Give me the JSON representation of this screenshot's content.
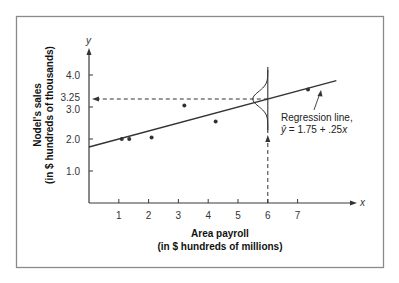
{
  "chart_data": {
    "type": "scatter",
    "title": "",
    "xlabel": "Area payroll",
    "xlabel_sub": "(in $ hundreds of millions)",
    "ylabel": "Nodel's sales",
    "ylabel_sub": "(in $ hundreds of thousands)",
    "x_var": "x",
    "y_var": "y",
    "xlim": [
      0,
      8.5
    ],
    "ylim": [
      0,
      4.6
    ],
    "x_ticks": [
      1,
      2,
      3,
      4,
      5,
      6,
      7
    ],
    "y_ticks": [
      {
        "value": 1.0,
        "label": "1.0"
      },
      {
        "value": 2.0,
        "label": "2.0"
      },
      {
        "value": 3.0,
        "label": "3.0"
      },
      {
        "value": 3.25,
        "label": "3.25"
      },
      {
        "value": 4.0,
        "label": "4.0"
      }
    ],
    "grid": false,
    "points": [
      {
        "x": 1.1,
        "y": 2.0
      },
      {
        "x": 1.35,
        "y": 2.0
      },
      {
        "x": 2.1,
        "y": 2.05
      },
      {
        "x": 3.2,
        "y": 3.05
      },
      {
        "x": 4.25,
        "y": 2.55
      },
      {
        "x": 7.35,
        "y": 3.55
      }
    ],
    "regression": {
      "intercept": 1.75,
      "slope": 0.25,
      "x_range": [
        0,
        8.3
      ],
      "label_line1": "Regression line,",
      "label_line2_yhat": "ŷ",
      "label_line2_rest": " = 1.75 + .25",
      "label_line2_var": "x"
    },
    "prediction": {
      "x": 6,
      "y": 3.25,
      "note": "dashed arrow from x=6 up to the line, then left to y=3.25; normal curve of y-distribution drawn at x=6"
    }
  },
  "style": {
    "frame_color": "#8a8a8a",
    "ink_color": "#333333"
  }
}
